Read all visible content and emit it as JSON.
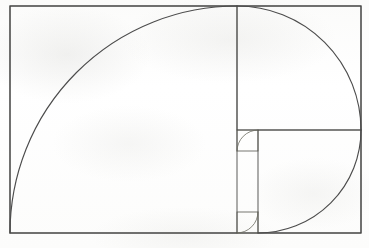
{
  "figure": {
    "title": "Fibonacci Golden Spiral Construction",
    "type": "geometric-diagram",
    "caption": "",
    "background_color": "#fdfdfd",
    "line_color": "#3a3a3a",
    "spiral_color": "#4c4c4c",
    "canvas": {
      "width": 369,
      "height": 248
    },
    "outer_rectangle": {
      "name": "golden-rectangle",
      "x": 10,
      "y": 6,
      "width": 351,
      "height": 227,
      "aspect_ratio": "1.546"
    },
    "squares": [
      {
        "index": 1,
        "label": "square-1",
        "x": 10,
        "y": 6,
        "size": 227
      },
      {
        "index": 2,
        "label": "square-2",
        "x": 237,
        "y": 6,
        "size": 124
      },
      {
        "index": 3,
        "label": "square-3",
        "x": 237,
        "y": 130,
        "size": 103
      },
      {
        "index": 4,
        "label": "square-4",
        "x": 340,
        "y": 130,
        "size": 21
      },
      {
        "index": 5,
        "label": "square-5",
        "x": 340,
        "y": 151,
        "size": 0
      }
    ],
    "divider_lines": [
      {
        "name": "divider-vertical-main",
        "x1": 237,
        "y1": 6,
        "x2": 237,
        "y2": 233
      },
      {
        "name": "divider-horizontal-1",
        "x1": 237,
        "y1": 130,
        "x2": 361,
        "y2": 130
      },
      {
        "name": "divider-vertical-2",
        "x1": 283,
        "y1": 130,
        "x2": 283,
        "y2": 233
      },
      {
        "name": "divider-horizontal-2",
        "x1": 237,
        "y1": 175,
        "x2": 283,
        "y2": 175
      },
      {
        "name": "divider-vertical-3",
        "x1": 265,
        "y1": 130,
        "x2": 265,
        "y2": 175
      },
      {
        "name": "divider-horizontal-3",
        "x1": 265,
        "y1": 157,
        "x2": 283,
        "y2": 157
      }
    ],
    "spiral": {
      "name": "golden-spiral",
      "turn_count": 6,
      "direction": "counter-clockwise-inward",
      "arcs": [
        {
          "index": 1,
          "quadrant": "bottom-left-to-top",
          "radius": 227,
          "center_x": 237,
          "center_y": 233
        },
        {
          "index": 2,
          "quadrant": "top-to-right",
          "radius": 124,
          "center_x": 237,
          "center_y": 130
        },
        {
          "index": 3,
          "quadrant": "right-to-bottom",
          "radius": 46,
          "center_x": 283,
          "center_y": 130
        },
        {
          "index": 4,
          "quadrant": "bottom-to-left",
          "radius": 28,
          "center_x": 265,
          "center_y": 175
        },
        {
          "index": 5,
          "quadrant": "left-to-top",
          "radius": 18,
          "center_x": 265,
          "center_y": 157
        },
        {
          "index": 6,
          "quadrant": "top-to-right",
          "radius": 11,
          "center_x": 272,
          "center_y": 157
        }
      ]
    }
  }
}
